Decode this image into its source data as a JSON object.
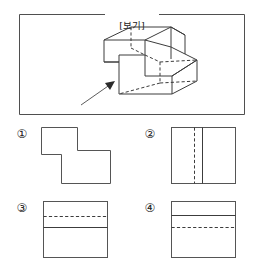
{
  "reference": {
    "label": "[보기]",
    "figure_name": "isometric-3d-solid",
    "arrow_name": "viewing-direction-arrow",
    "arrow_description": "arrow pointing up-right toward the solid indicating the view direction"
  },
  "colors": {
    "ink": "#3c3c3c",
    "frame": "#4f4f4f",
    "background": "#ffffff",
    "marker": "#222222"
  },
  "options": [
    {
      "marker": "①",
      "number": "1",
      "shape": "step-polygon",
      "description": "Z/step shaped outline, no interior lines"
    },
    {
      "marker": "②",
      "number": "2",
      "shape": "square-with-vertical-lines",
      "description": "Square with a dashed vertical line and a solid vertical line"
    },
    {
      "marker": "③",
      "number": "3",
      "shape": "square-with-horizontal-lines",
      "description": "Square with a dashed horizontal line above a solid horizontal line"
    },
    {
      "marker": "④",
      "number": "4",
      "shape": "square-with-horizontal-lines",
      "description": "Square with a solid horizontal line above a dashed horizontal line"
    }
  ]
}
